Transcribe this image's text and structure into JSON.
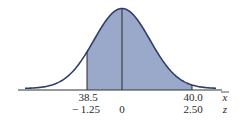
{
  "chart_data": {
    "type": "area",
    "title": "",
    "axes": [
      {
        "variable": "x̄",
        "ticks": [
          {
            "value": "38.5",
            "position": "left_bound"
          },
          {
            "value": "40.0",
            "position": "right_bound"
          }
        ]
      },
      {
        "variable": "z",
        "ticks": [
          {
            "value": "-1.25",
            "position": "left_bound"
          },
          {
            "value": "0",
            "position": "mean"
          },
          {
            "value": "2.50",
            "position": "right_bound"
          }
        ]
      }
    ],
    "shaded_region": {
      "z_from": -1.25,
      "z_to": 2.5,
      "x_from": 38.5,
      "x_to": 40.0
    },
    "mean_line": {
      "z": 0
    },
    "colors": {
      "curve": "#2e3f6e",
      "fill": "#9aa9c9",
      "axis": "#333333"
    },
    "grid": false,
    "legend": "none"
  },
  "labels": {
    "xbar_left": "38.5",
    "xbar_right": "40.0",
    "xbar_symbol": "x",
    "z_left": "− 1.25",
    "z_mid": "0",
    "z_right": "2.50",
    "z_symbol": "z"
  }
}
